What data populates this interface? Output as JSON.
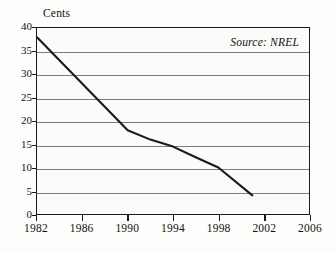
{
  "chart_data": {
    "type": "line",
    "title": "",
    "xlabel": "",
    "ylabel": "Cents",
    "xlim": [
      1982,
      2006
    ],
    "ylim": [
      0,
      40
    ],
    "grid": true,
    "legend": null,
    "annotations": [
      {
        "name": "source",
        "text": "Source: NREL",
        "position": "top-right-inside"
      }
    ],
    "yticks": [
      40,
      35,
      30,
      25,
      20,
      15,
      10,
      5,
      0
    ],
    "ytick_labels": [
      "40",
      "35",
      "30",
      "25",
      "20",
      "15",
      "10",
      "5",
      "0"
    ],
    "xticks": [
      1982,
      1986,
      1990,
      1994,
      1998,
      2002,
      2006
    ],
    "xtick_labels": [
      "1982",
      "1986",
      "1990",
      "1994",
      "1998",
      "2002",
      "2006"
    ],
    "series": [
      {
        "name": "Cost per kilowatt-hour",
        "color": "#1a1a1a",
        "x": [
          1982,
          1990,
          1992,
          1994,
          1996,
          1998,
          2001
        ],
        "values": [
          38,
          18,
          16,
          14.5,
          12.2,
          10,
          4
        ]
      }
    ]
  },
  "axes": {
    "y_title": "Cents",
    "line_color": "#1a1a1a",
    "grid_color": "#7d7d7d",
    "background": "#fbfbfa"
  },
  "source": {
    "text": "Source: NREL"
  }
}
